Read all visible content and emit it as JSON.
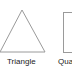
{
  "shapes": [
    {
      "name": "Triangle",
      "label": "Triangle"
    },
    {
      "name": "Square",
      "label": "Quadrilateral"
    }
  ],
  "colors": {
    "stroke": "#9a9a9a",
    "text": "#222222",
    "background": "#ffffff"
  }
}
